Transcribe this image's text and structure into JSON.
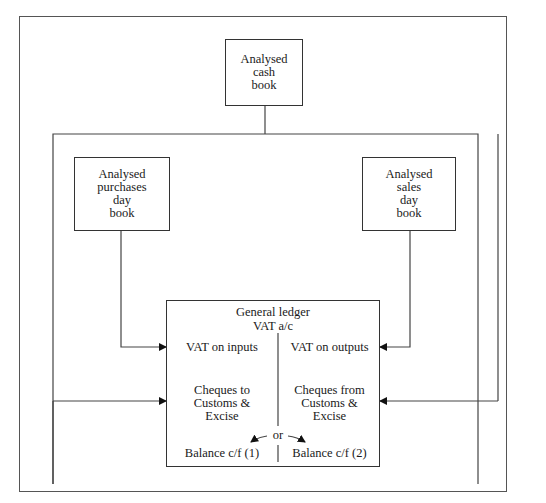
{
  "diagram": {
    "nodes": {
      "cash_book": {
        "lines": [
          "Analysed",
          "cash",
          "book"
        ]
      },
      "purchases_day_book": {
        "lines": [
          "Analysed",
          "purchases",
          "day",
          "book"
        ]
      },
      "sales_day_book": {
        "lines": [
          "Analysed",
          "sales",
          "day",
          "book"
        ]
      },
      "general_ledger": {
        "title": "General ledger",
        "subtitle": "VAT a/c",
        "left": {
          "row1": "VAT on inputs",
          "row2": [
            "Cheques to",
            "Customs &",
            "Excise"
          ],
          "row3": "Balance c/f (1)"
        },
        "right": {
          "row1": "VAT on outputs",
          "row2": [
            "Cheques from",
            "Customs &",
            "Excise"
          ],
          "row3": "Balance c/f (2)"
        },
        "or_label": "or"
      }
    },
    "edges": [
      {
        "from": "purchases_day_book",
        "to": "general_ledger.left.row1"
      },
      {
        "from": "sales_day_book",
        "to": "general_ledger.right.row1"
      },
      {
        "from": "cash_book",
        "to": "general_ledger.left.row2"
      },
      {
        "from": "cash_book",
        "to": "general_ledger.right.row2"
      }
    ]
  }
}
